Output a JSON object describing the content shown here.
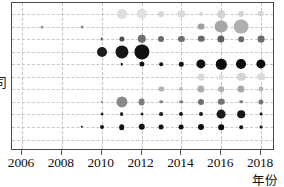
{
  "chart_data": {
    "type": "scatter",
    "title": "",
    "xlabel": "年份",
    "ylabel": "司",
    "xlim": [
      2005.5,
      2018.7
    ],
    "ylim": [
      0,
      11
    ],
    "grid": true,
    "legend": null,
    "x_ticks": [
      "2006",
      "2008",
      "2010",
      "2012",
      "2014",
      "2016",
      "2018"
    ],
    "x_tick_values": [
      2006,
      2008,
      2010,
      2012,
      2014,
      2016,
      2018
    ],
    "y_rows": 11,
    "marker_shape": "circle",
    "size_encodes": "magnitude",
    "color_encodes": "grayscale shade",
    "points": [
      {
        "x": 2011,
        "row": 1,
        "size": 5.0,
        "shade": "#dcdcdc"
      },
      {
        "x": 2012,
        "row": 1,
        "size": 5.2,
        "shade": "#dfdfdf"
      },
      {
        "x": 2013,
        "row": 1,
        "size": 2.8,
        "shade": "#d8d8d8"
      },
      {
        "x": 2014,
        "row": 1,
        "size": 3.6,
        "shade": "#dadada"
      },
      {
        "x": 2015,
        "row": 1,
        "size": 2.0,
        "shade": "#d6d6d6"
      },
      {
        "x": 2016,
        "row": 1,
        "size": 3.8,
        "shade": "#d2d2d2"
      },
      {
        "x": 2017,
        "row": 1,
        "size": 3.0,
        "shade": "#d4d4d4"
      },
      {
        "x": 2018,
        "row": 1,
        "size": 3.2,
        "shade": "#d7d7d7"
      },
      {
        "x": 2007,
        "row": 2,
        "size": 1.6,
        "shade": "#9a9a9a"
      },
      {
        "x": 2009,
        "row": 2,
        "size": 1.5,
        "shade": "#8f8f8f"
      },
      {
        "x": 2015,
        "row": 2,
        "size": 3.4,
        "shade": "#9e9e9e"
      },
      {
        "x": 2016,
        "row": 2,
        "size": 6.4,
        "shade": "#a6a6a6"
      },
      {
        "x": 2017,
        "row": 2,
        "size": 7.4,
        "shade": "#b0b0b0"
      },
      {
        "x": 2010,
        "row": 3,
        "size": 1.4,
        "shade": "#555555"
      },
      {
        "x": 2011,
        "row": 3,
        "size": 2.6,
        "shade": "#4a4a4a"
      },
      {
        "x": 2012,
        "row": 3,
        "size": 4.2,
        "shade": "#6e6e6e"
      },
      {
        "x": 2013,
        "row": 3,
        "size": 3.0,
        "shade": "#6a6a6a"
      },
      {
        "x": 2014,
        "row": 3,
        "size": 3.1,
        "shade": "#707070"
      },
      {
        "x": 2015,
        "row": 3,
        "size": 3.2,
        "shade": "#686868"
      },
      {
        "x": 2016,
        "row": 3,
        "size": 3.6,
        "shade": "#5e5e5e"
      },
      {
        "x": 2017,
        "row": 3,
        "size": 2.8,
        "shade": "#6c6c6c"
      },
      {
        "x": 2018,
        "row": 3,
        "size": 3.4,
        "shade": "#6a6a6a"
      },
      {
        "x": 2010,
        "row": 4,
        "size": 5.0,
        "shade": "#1c1c1c"
      },
      {
        "x": 2011,
        "row": 4,
        "size": 6.6,
        "shade": "#161616"
      },
      {
        "x": 2012,
        "row": 4,
        "size": 7.6,
        "shade": "#111111"
      },
      {
        "x": 2011,
        "row": 5,
        "size": 1.3,
        "shade": "#1a1a1a"
      },
      {
        "x": 2012,
        "row": 5,
        "size": 2.6,
        "shade": "#121212"
      },
      {
        "x": 2013,
        "row": 5,
        "size": 1.8,
        "shade": "#141414"
      },
      {
        "x": 2014,
        "row": 5,
        "size": 2.2,
        "shade": "#111111"
      },
      {
        "x": 2015,
        "row": 5,
        "size": 4.6,
        "shade": "#0d0d0d"
      },
      {
        "x": 2016,
        "row": 5,
        "size": 5.2,
        "shade": "#0b0b0b"
      },
      {
        "x": 2017,
        "row": 5,
        "size": 5.0,
        "shade": "#0b0b0b"
      },
      {
        "x": 2018,
        "row": 5,
        "size": 4.6,
        "shade": "#0d0d0d"
      },
      {
        "x": 2015,
        "row": 6,
        "size": 3.4,
        "shade": "#d9d9d9"
      },
      {
        "x": 2016,
        "row": 6,
        "size": 2.4,
        "shade": "#dcdcdc"
      },
      {
        "x": 2017,
        "row": 6,
        "size": 4.2,
        "shade": "#d5d5d5"
      },
      {
        "x": 2018,
        "row": 6,
        "size": 3.8,
        "shade": "#dadada"
      },
      {
        "x": 2013,
        "row": 7,
        "size": 2.6,
        "shade": "#b4b4b4"
      },
      {
        "x": 2014,
        "row": 7,
        "size": 2.0,
        "shade": "#bdbdbd"
      },
      {
        "x": 2015,
        "row": 7,
        "size": 3.6,
        "shade": "#acacac"
      },
      {
        "x": 2016,
        "row": 7,
        "size": 2.8,
        "shade": "#b2b2b2"
      },
      {
        "x": 2017,
        "row": 7,
        "size": 3.6,
        "shade": "#a8a8a8"
      },
      {
        "x": 2018,
        "row": 7,
        "size": 2.6,
        "shade": "#b6b6b6"
      },
      {
        "x": 2010,
        "row": 8,
        "size": 1.3,
        "shade": "#7a7a7a"
      },
      {
        "x": 2011,
        "row": 8,
        "size": 5.6,
        "shade": "#8a8a8a"
      },
      {
        "x": 2012,
        "row": 8,
        "size": 3.4,
        "shade": "#7e7e7e"
      },
      {
        "x": 2013,
        "row": 8,
        "size": 1.8,
        "shade": "#848484"
      },
      {
        "x": 2014,
        "row": 8,
        "size": 1.8,
        "shade": "#7c7c7c"
      },
      {
        "x": 2015,
        "row": 8,
        "size": 3.0,
        "shade": "#6f6f6f"
      },
      {
        "x": 2016,
        "row": 8,
        "size": 3.2,
        "shade": "#757575"
      },
      {
        "x": 2017,
        "row": 8,
        "size": 1.8,
        "shade": "#7f7f7f"
      },
      {
        "x": 2018,
        "row": 8,
        "size": 2.6,
        "shade": "#787878"
      },
      {
        "x": 2010,
        "row": 9,
        "size": 1.5,
        "shade": "#2a2a2a"
      },
      {
        "x": 2011,
        "row": 9,
        "size": 1.9,
        "shade": "#242424"
      },
      {
        "x": 2012,
        "row": 9,
        "size": 1.5,
        "shade": "#262626"
      },
      {
        "x": 2013,
        "row": 9,
        "size": 1.9,
        "shade": "#1f1f1f"
      },
      {
        "x": 2014,
        "row": 9,
        "size": 2.0,
        "shade": "#1c1c1c"
      },
      {
        "x": 2015,
        "row": 9,
        "size": 2.0,
        "shade": "#1a1a1a"
      },
      {
        "x": 2016,
        "row": 9,
        "size": 4.4,
        "shade": "#1a1a1a"
      },
      {
        "x": 2017,
        "row": 9,
        "size": 3.8,
        "shade": "#161616"
      },
      {
        "x": 2018,
        "row": 9,
        "size": 1.4,
        "shade": "#1f1f1f"
      },
      {
        "x": 2009,
        "row": 10,
        "size": 1.2,
        "shade": "#1c1c1c"
      },
      {
        "x": 2010,
        "row": 10,
        "size": 2.0,
        "shade": "#151515"
      },
      {
        "x": 2011,
        "row": 10,
        "size": 2.8,
        "shade": "#121212"
      },
      {
        "x": 2012,
        "row": 10,
        "size": 3.2,
        "shade": "#0f0f0f"
      },
      {
        "x": 2013,
        "row": 10,
        "size": 2.4,
        "shade": "#121212"
      },
      {
        "x": 2014,
        "row": 10,
        "size": 2.4,
        "shade": "#101010"
      },
      {
        "x": 2015,
        "row": 10,
        "size": 3.0,
        "shade": "#0e0e0e"
      },
      {
        "x": 2016,
        "row": 10,
        "size": 2.8,
        "shade": "#0e0e0e"
      },
      {
        "x": 2017,
        "row": 10,
        "size": 1.8,
        "shade": "#141414"
      },
      {
        "x": 2018,
        "row": 10,
        "size": 1.4,
        "shade": "#181818"
      }
    ]
  },
  "axis": {
    "x_title": "年份",
    "y_title": "司"
  }
}
